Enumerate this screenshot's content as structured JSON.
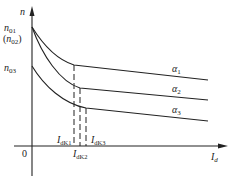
{
  "diagram": {
    "title": "",
    "axes": {
      "y_label": "n",
      "x_label": "I",
      "x_label_sub": "d",
      "origin": "0"
    },
    "y_ticks": {
      "n01": {
        "main": "n",
        "sub": "01"
      },
      "n02": {
        "paren_open": "(",
        "main": "n",
        "sub": "02",
        "paren_close": ")"
      },
      "n03": {
        "main": "n",
        "sub": "03"
      }
    },
    "curves": [
      {
        "name": "α",
        "sub": "1"
      },
      {
        "name": "α",
        "sub": "2"
      },
      {
        "name": "α",
        "sub": "3"
      }
    ],
    "current_marks": [
      {
        "main": "I",
        "sub": "dK1"
      },
      {
        "main": "I",
        "sub": "dK2"
      },
      {
        "main": "I",
        "sub": "dK3"
      }
    ],
    "colors": {
      "line": "#222222",
      "background": "#ffffff"
    }
  }
}
